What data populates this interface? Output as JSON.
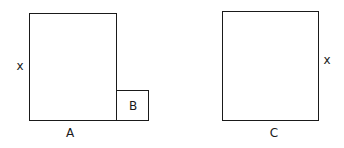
{
  "diagram": {
    "figures": [
      {
        "id": "left",
        "shapes": [
          {
            "name": "A",
            "kind": "rectangle",
            "side_label": "x",
            "bottom_label": "A"
          },
          {
            "name": "B",
            "kind": "square",
            "inner_label": "B"
          }
        ]
      },
      {
        "id": "right",
        "shapes": [
          {
            "name": "C",
            "kind": "rectangle",
            "side_label": "x",
            "bottom_label": "C"
          }
        ]
      }
    ],
    "labels": {
      "left_x": "x",
      "a": "A",
      "b": "B",
      "right_x": "x",
      "c": "C"
    },
    "colors": {
      "stroke": "#1a1a1a",
      "background": "#ffffff"
    }
  }
}
